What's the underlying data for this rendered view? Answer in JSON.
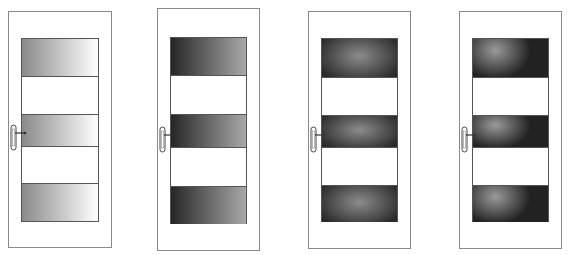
{
  "figure": {
    "doors": [
      {
        "id": "door-1",
        "glass_style": "linear-gradient",
        "glass_colors": [
          "#8a8a8a",
          "#ffffff"
        ],
        "panels": 3
      },
      {
        "id": "door-2",
        "glass_style": "linear-gradient",
        "glass_colors": [
          "#262626",
          "#a8a8a8"
        ],
        "panels": 3
      },
      {
        "id": "door-3",
        "glass_style": "radial-gradient",
        "glass_colors": [
          "#8c8c8c",
          "#2a2a2a"
        ],
        "panels": 3
      },
      {
        "id": "door-4",
        "glass_style": "offset-radial-gradient",
        "glass_colors": [
          "#9a9a9a",
          "#222222"
        ],
        "panels": 3
      }
    ]
  }
}
